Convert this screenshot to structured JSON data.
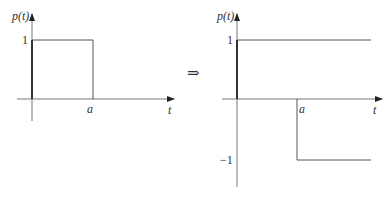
{
  "left_plot": {
    "y_label": "p(t)",
    "x_label": "t",
    "tick_one": "1",
    "tick_a": "a"
  },
  "implies_symbol": "⇒",
  "right_plot": {
    "y_label": "p(t)",
    "x_label": "t",
    "tick_one": "1",
    "tick_minus_one": "−1",
    "tick_a": "a"
  },
  "colors": {
    "line": "#444444",
    "axis": "#555555"
  }
}
